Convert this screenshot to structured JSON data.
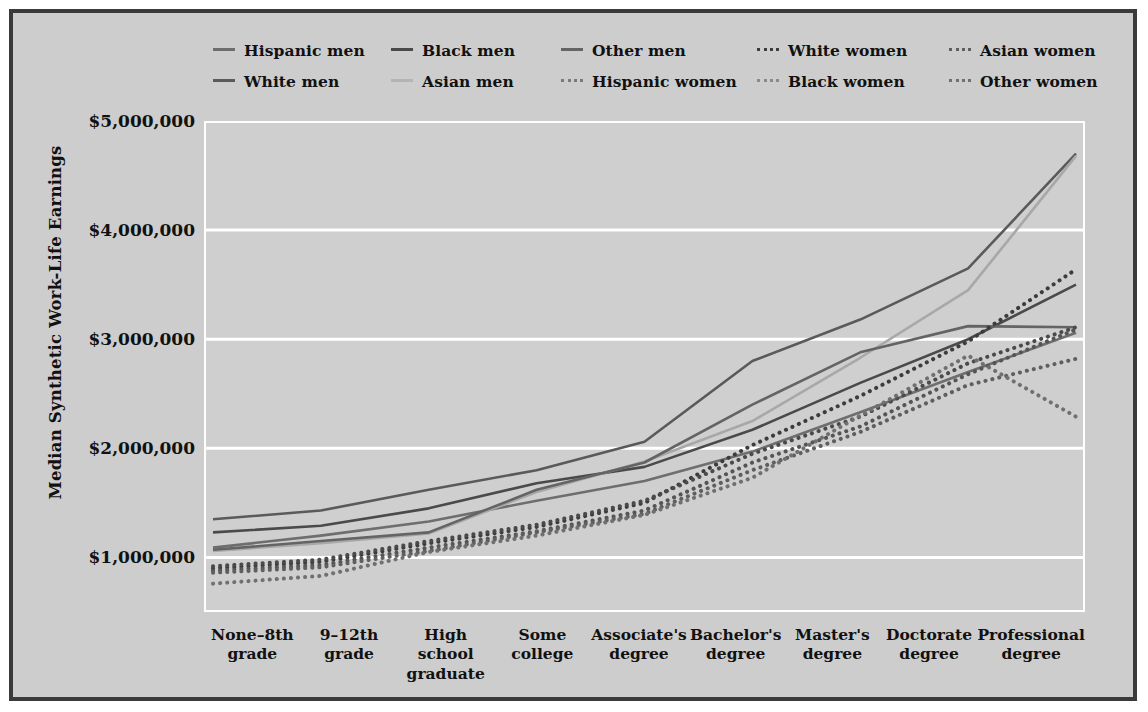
{
  "chart_data": {
    "type": "line",
    "title": "",
    "xlabel": "",
    "ylabel": "Median Synthetic Work-Life Earnings",
    "ylim": [
      500000,
      5000000
    ],
    "grid": true,
    "legend_position": "top",
    "ytick_labels": [
      "$5,000,000",
      "$4,000,000",
      "$3,000,000",
      "$2,000,000",
      "$1,000,000"
    ],
    "ytick_values": [
      5000000,
      4000000,
      3000000,
      2000000,
      1000000
    ],
    "categories": [
      "None–8th grade",
      "9–12th grade",
      "High school graduate",
      "Some college",
      "Associate's degree",
      "Bachelor's degree",
      "Master's degree",
      "Doctorate degree",
      "Professional degree"
    ],
    "category_lines": [
      [
        "None–8th",
        "grade"
      ],
      [
        "9–12th",
        "grade"
      ],
      [
        "High school",
        "graduate"
      ],
      [
        "Some",
        "college"
      ],
      [
        "Associate's",
        "degree"
      ],
      [
        "Bachelor's",
        "degree"
      ],
      [
        "Master's",
        "degree"
      ],
      [
        "Doctorate",
        "degree"
      ],
      [
        "Professional",
        "degree"
      ]
    ],
    "series": [
      {
        "name": "Hispanic men",
        "style": "solid",
        "color": "#6e6e6e",
        "values": [
          1090000,
          1200000,
          1330000,
          1520000,
          1700000,
          1970000,
          2330000,
          2700000,
          3060000
        ]
      },
      {
        "name": "White men",
        "style": "solid",
        "color": "#5a5a5a",
        "values": [
          1350000,
          1430000,
          1620000,
          1800000,
          2060000,
          2800000,
          3180000,
          3650000,
          4700000
        ]
      },
      {
        "name": "Black men",
        "style": "solid",
        "color": "#4a4a4a",
        "values": [
          1230000,
          1290000,
          1450000,
          1680000,
          1830000,
          2170000,
          2600000,
          3000000,
          3500000
        ]
      },
      {
        "name": "Asian men",
        "style": "solid",
        "color": "#a8a8a8",
        "values": [
          1060000,
          1130000,
          1220000,
          1600000,
          1880000,
          2250000,
          2830000,
          3450000,
          4680000
        ]
      },
      {
        "name": "Other men",
        "style": "solid",
        "color": "#646464",
        "values": [
          1070000,
          1150000,
          1230000,
          1620000,
          1870000,
          2400000,
          2880000,
          3120000,
          3110000
        ]
      },
      {
        "name": "White women",
        "style": "dotted",
        "color": "#3c3c3c",
        "values": [
          900000,
          960000,
          1130000,
          1280000,
          1500000,
          2030000,
          2480000,
          2980000,
          3640000
        ]
      },
      {
        "name": "Hispanic women",
        "style": "dotted",
        "color": "#555555",
        "values": [
          880000,
          930000,
          1090000,
          1240000,
          1430000,
          1870000,
          2200000,
          2680000,
          3090000
        ]
      },
      {
        "name": "Black women",
        "style": "dotted",
        "color": "#4a4a4a",
        "values": [
          920000,
          980000,
          1150000,
          1300000,
          1520000,
          1950000,
          2290000,
          2780000,
          3110000
        ]
      },
      {
        "name": "Asian women",
        "style": "dotted",
        "color": "#5f5f5f",
        "values": [
          860000,
          910000,
          1060000,
          1230000,
          1400000,
          1800000,
          2150000,
          2580000,
          2820000
        ]
      },
      {
        "name": "Other women",
        "style": "dotted",
        "color": "#707070",
        "values": [
          760000,
          830000,
          1050000,
          1200000,
          1390000,
          1730000,
          2300000,
          2850000,
          2290000
        ]
      }
    ]
  },
  "legend": {
    "rows": [
      [
        "Hispanic men",
        "Black men",
        "Other men",
        "White women",
        "Asian women"
      ],
      [
        "White men",
        "Asian men",
        "Hispanic women",
        "Black women",
        "Other women"
      ]
    ]
  }
}
